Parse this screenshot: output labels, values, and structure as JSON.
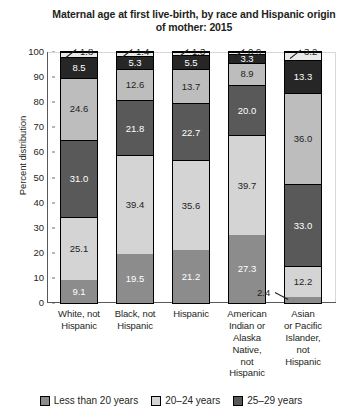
{
  "chart_data": {
    "type": "bar",
    "subtype": "stacked-vertical-100",
    "title": "Maternal age at first live-birth, by race and Hispanic origin of mother: 2015",
    "xlabel": "",
    "ylabel": "Percent distribution",
    "ylim": [
      0,
      100
    ],
    "yticks": [
      0,
      10,
      20,
      30,
      40,
      50,
      60,
      70,
      80,
      90,
      100
    ],
    "grid": false,
    "legend_position": "bottom",
    "categories": [
      "White, not Hispanic",
      "Black, not Hispanic",
      "Hispanic",
      "American Indian or Alaska Native, not Hispanic",
      "Asian or Pacific Islander, not Hispanic"
    ],
    "series": [
      {
        "name": "Less than 20 years",
        "color": "#8c8c8c",
        "values": [
          9.1,
          19.5,
          21.2,
          27.3,
          2.4
        ]
      },
      {
        "name": "20–24 years",
        "color": "#d4d4d4",
        "values": [
          25.1,
          39.4,
          35.6,
          39.7,
          12.2
        ]
      },
      {
        "name": "25–29 years",
        "color": "#595959",
        "values": [
          31.0,
          21.8,
          22.7,
          20.0,
          33.0
        ]
      },
      {
        "name": "30–34 years",
        "color": "#bdbdbd",
        "values": [
          24.6,
          12.6,
          13.7,
          8.9,
          36.0
        ]
      },
      {
        "name": "35–39 years",
        "color": "#262626",
        "values": [
          8.5,
          5.3,
          5.5,
          3.3,
          13.3
        ]
      },
      {
        "name": "40 years and over",
        "color": "#e8e8e8",
        "values": [
          1.8,
          1.4,
          1.3,
          0.9,
          3.2
        ]
      }
    ]
  },
  "axis": {
    "y_title": "Percent distribution",
    "y_ticks": [
      "100",
      "90",
      "80",
      "70",
      "60",
      "50",
      "40",
      "30",
      "20",
      "10",
      "0"
    ]
  },
  "title": {
    "line1": "Maternal age at first live-birth, by race and Hispanic",
    "line2": "origin of mother: 2015"
  },
  "x_labels": [
    "White, not\nHispanic",
    "Black, not\nHispanic",
    "Hispanic",
    "American\nIndian or\nAlaska\nNative,\nnot\nHispanic",
    "Asian\nor Pacific\nIslander,\nnot\nHispanic"
  ],
  "bars": [
    {
      "name": "white-not-hispanic",
      "segments": [
        {
          "label": "9.1",
          "value": 9.1,
          "shade": "c0",
          "inline": true
        },
        {
          "label": "25.1",
          "value": 25.1,
          "shade": "c1",
          "inline": true
        },
        {
          "label": "31.0",
          "value": 31.0,
          "shade": "c2",
          "inline": true
        },
        {
          "label": "24.6",
          "value": 24.6,
          "shade": "c3",
          "inline": true
        },
        {
          "label": "8.5",
          "value": 8.5,
          "shade": "c4",
          "inline": true
        },
        {
          "label": "1.8",
          "value": 1.8,
          "shade": "c5",
          "inline": false
        }
      ]
    },
    {
      "name": "black-not-hispanic",
      "segments": [
        {
          "label": "19.5",
          "value": 19.5,
          "shade": "c0",
          "inline": true
        },
        {
          "label": "39.4",
          "value": 39.4,
          "shade": "c1",
          "inline": true
        },
        {
          "label": "21.8",
          "value": 21.8,
          "shade": "c2",
          "inline": true
        },
        {
          "label": "12.6",
          "value": 12.6,
          "shade": "c3",
          "inline": true
        },
        {
          "label": "5.3",
          "value": 5.3,
          "shade": "c4",
          "inline": true
        },
        {
          "label": "1.4",
          "value": 1.4,
          "shade": "c5",
          "inline": false
        }
      ]
    },
    {
      "name": "hispanic",
      "segments": [
        {
          "label": "21.2",
          "value": 21.2,
          "shade": "c0",
          "inline": true
        },
        {
          "label": "35.6",
          "value": 35.6,
          "shade": "c1",
          "inline": true
        },
        {
          "label": "22.7",
          "value": 22.7,
          "shade": "c2",
          "inline": true
        },
        {
          "label": "13.7",
          "value": 13.7,
          "shade": "c3",
          "inline": true
        },
        {
          "label": "5.5",
          "value": 5.5,
          "shade": "c4",
          "inline": true
        },
        {
          "label": "1.3",
          "value": 1.3,
          "shade": "c5",
          "inline": false
        }
      ]
    },
    {
      "name": "american-indian-alaska-native",
      "segments": [
        {
          "label": "27.3",
          "value": 27.3,
          "shade": "c0",
          "inline": true
        },
        {
          "label": "39.7",
          "value": 39.7,
          "shade": "c1",
          "inline": true
        },
        {
          "label": "20.0",
          "value": 20.0,
          "shade": "c2",
          "inline": true
        },
        {
          "label": "8.9",
          "value": 8.9,
          "shade": "c3",
          "inline": true
        },
        {
          "label": "3.3",
          "value": 3.3,
          "shade": "c4",
          "inline": true
        },
        {
          "label": "0.9",
          "value": 0.9,
          "shade": "c5",
          "inline": false
        }
      ]
    },
    {
      "name": "asian-pacific-islander",
      "segments": [
        {
          "label": "2.4",
          "value": 2.4,
          "shade": "c0",
          "inline": false
        },
        {
          "label": "12.2",
          "value": 12.2,
          "shade": "c1",
          "inline": true
        },
        {
          "label": "33.0",
          "value": 33.0,
          "shade": "c2",
          "inline": true
        },
        {
          "label": "36.0",
          "value": 36.0,
          "shade": "c3",
          "inline": true
        },
        {
          "label": "13.3",
          "value": 13.3,
          "shade": "c4",
          "inline": true
        },
        {
          "label": "3.2",
          "value": 3.2,
          "shade": "c5",
          "inline": false
        }
      ]
    }
  ],
  "callouts": [
    {
      "name": "callout-white-40plus",
      "text": "1.8",
      "x": 80,
      "y": 47,
      "lx": 66,
      "ly": 57,
      "len": 13,
      "ang": -38
    },
    {
      "name": "callout-black-40plus",
      "text": "1.4",
      "x": 136,
      "y": 47,
      "lx": 122,
      "ly": 57,
      "len": 13,
      "ang": -38
    },
    {
      "name": "callout-hispanic-40plus",
      "text": "1.3",
      "x": 192,
      "y": 47,
      "lx": 178,
      "ly": 57,
      "len": 13,
      "ang": -38
    },
    {
      "name": "callout-aian-40plus",
      "text": "0.9",
      "x": 248,
      "y": 47,
      "lx": 234,
      "ly": 57,
      "len": 13,
      "ang": -38
    },
    {
      "name": "callout-api-40plus",
      "text": "3.2",
      "x": 304,
      "y": 47,
      "lx": 290,
      "ly": 58,
      "len": 14,
      "ang": -38
    },
    {
      "name": "callout-api-under20",
      "text": "2.4",
      "x": 257,
      "y": 288,
      "lx": 275,
      "ly": 292,
      "len": 15,
      "ang": 28
    }
  ],
  "legend": {
    "items": [
      {
        "name": "legend-less-than-20",
        "label": "Less than 20 years",
        "shade": "c0"
      },
      {
        "name": "legend-20-24",
        "label": "20–24 years",
        "shade": "c1"
      },
      {
        "name": "legend-25-29",
        "label": "25–29 years",
        "shade": "c2"
      }
    ]
  }
}
